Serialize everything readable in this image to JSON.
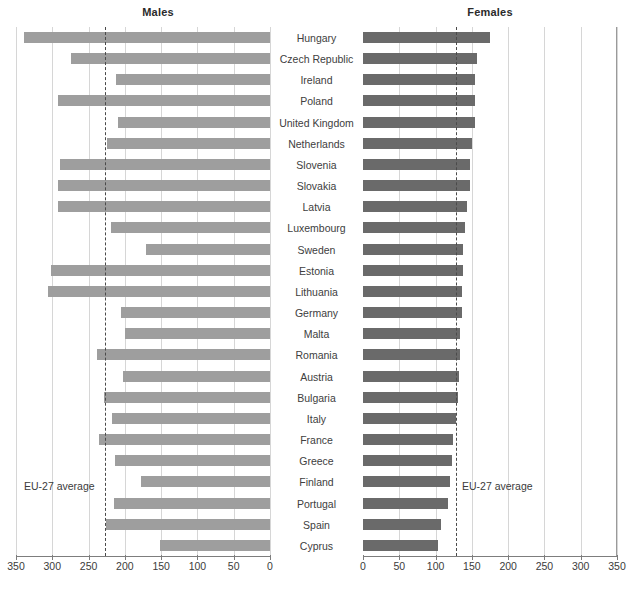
{
  "panels": {
    "left": {
      "title": "Males",
      "axis_direction": "reversed"
    },
    "right": {
      "title": "Females",
      "axis_direction": "normal"
    }
  },
  "annotations": {
    "eu27_left_label": "EU-27 average",
    "eu27_right_label": "EU-27 average"
  },
  "colors": {
    "male_bar": "#9e9e9e",
    "female_bar": "#6a6a6a",
    "gridline": "#d6d6d6",
    "axis": "#7d7d7d",
    "average_line": "#4a4a4a",
    "text": "#3b3b3b"
  },
  "chart_data": {
    "type": "bar",
    "title": "",
    "subtitle": "",
    "orientation": "horizontal",
    "layout": "butterfly / back-to-back paired bar chart",
    "xlabel": "",
    "ylabel": "",
    "xlim": [
      0,
      350
    ],
    "xticks": [
      0,
      50,
      100,
      150,
      200,
      250,
      300,
      350
    ],
    "left_axis_ticks": [
      350,
      300,
      250,
      200,
      150,
      100,
      50,
      0
    ],
    "right_axis_ticks": [
      0,
      50,
      100,
      150,
      200,
      250,
      300,
      350
    ],
    "grid": true,
    "legend": false,
    "categories": [
      "Hungary",
      "Czech Republic",
      "Ireland",
      "Poland",
      "United Kingdom",
      "Netherlands",
      "Slovenia",
      "Slovakia",
      "Latvia",
      "Luxembourg",
      "Sweden",
      "Estonia",
      "Lithuania",
      "Germany",
      "Malta",
      "Romania",
      "Austria",
      "Bulgaria",
      "Italy",
      "France",
      "Greece",
      "Finland",
      "Portugal",
      "Spain",
      "Cyprus"
    ],
    "series": [
      {
        "name": "Males",
        "panel": "left",
        "color": "#9e9e9e",
        "values": [
          339,
          274,
          212,
          292,
          209,
          225,
          289,
          292,
          292,
          219,
          171,
          302,
          306,
          205,
          200,
          238,
          202,
          229,
          218,
          236,
          214,
          178,
          215,
          226,
          151
        ]
      },
      {
        "name": "Females",
        "panel": "right",
        "color": "#6a6a6a",
        "values": [
          175,
          157,
          155,
          155,
          155,
          150,
          148,
          147,
          143,
          141,
          138,
          138,
          136,
          136,
          134,
          133,
          132,
          131,
          128,
          124,
          122,
          120,
          117,
          108,
          104
        ]
      }
    ],
    "reference_lines": [
      {
        "panel": "left",
        "label": "EU-27 average",
        "value": 227
      },
      {
        "panel": "right",
        "label": "EU-27 average",
        "value": 128
      }
    ]
  }
}
